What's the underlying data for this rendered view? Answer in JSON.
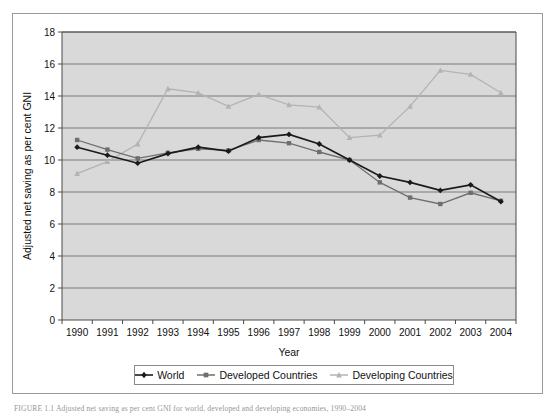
{
  "figure": {
    "caption": "FIGURE 1.1  Adjusted net saving as per cent GNI for world, developed and developing economies, 1990–2004"
  },
  "legend": {
    "position": "bottom-center",
    "entries": [
      {
        "label": "World",
        "color": "#1a1a1a",
        "marker": "diamond"
      },
      {
        "label": "Developed Countries",
        "color": "#6e6e6e",
        "marker": "square"
      },
      {
        "label": "Developing Countries",
        "color": "#b3b3b3",
        "marker": "triangle"
      }
    ]
  },
  "chart_data": {
    "type": "line",
    "title": "",
    "xlabel": "Year",
    "ylabel": "Adjusted net saving as per cent GNI",
    "categories": [
      "1990",
      "1991",
      "1992",
      "1993",
      "1994",
      "1995",
      "1996",
      "1997",
      "1998",
      "1999",
      "2000",
      "2001",
      "2002",
      "2003",
      "2004"
    ],
    "xtick_labels": [
      "1990",
      "1991",
      "1992",
      "1993",
      "1994",
      "1995",
      "1996",
      "1997",
      "1998",
      "1999",
      "2000",
      "2001",
      "2002",
      "2003",
      "2004"
    ],
    "ytick_labels": [
      "0",
      "2",
      "4",
      "6",
      "8",
      "10",
      "12",
      "14",
      "16",
      "18"
    ],
    "yticks": [
      0,
      2,
      4,
      6,
      8,
      10,
      12,
      14,
      16,
      18
    ],
    "ylim": [
      0,
      18
    ],
    "grid": "horizontal",
    "plot_background": "#d9d9d9",
    "series": [
      {
        "name": "World",
        "color": "#1a1a1a",
        "marker": "diamond",
        "values": [
          10.8,
          10.3,
          9.8,
          10.4,
          10.8,
          10.55,
          11.4,
          11.6,
          11.0,
          10.0,
          9.0,
          8.6,
          8.1,
          8.45,
          7.4
        ]
      },
      {
        "name": "Developed Countries",
        "color": "#6e6e6e",
        "marker": "square",
        "values": [
          11.25,
          10.65,
          10.1,
          10.45,
          10.7,
          10.6,
          11.25,
          11.05,
          10.5,
          10.0,
          8.6,
          7.65,
          7.25,
          7.95,
          7.45
        ]
      },
      {
        "name": "Developing Countries",
        "color": "#b3b3b3",
        "marker": "triangle",
        "values": [
          9.15,
          9.9,
          11.0,
          14.45,
          14.2,
          13.35,
          14.1,
          13.45,
          13.3,
          11.4,
          11.55,
          13.35,
          15.6,
          15.35,
          14.2
        ]
      }
    ]
  }
}
